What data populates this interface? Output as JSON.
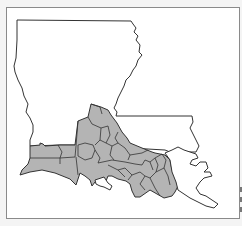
{
  "map": {
    "region": "Louisiana",
    "style": {
      "fill_highlight": "#b4b4b4",
      "fill_base": "#ffffff",
      "stroke": "#333333",
      "frame": "#8a8a8a"
    },
    "highlighted_region": "South Louisiana parishes"
  }
}
